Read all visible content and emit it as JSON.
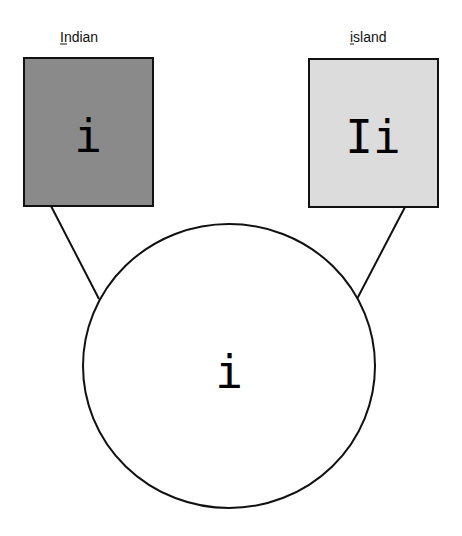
{
  "diagram": {
    "boxes": [
      {
        "id": "left",
        "label": "Indian",
        "mnemonic_index": 0,
        "glyph": "i",
        "fill": "#8a8a8a"
      },
      {
        "id": "right",
        "label": "island",
        "mnemonic_index": 0,
        "glyph": "Ii",
        "fill": "#dcdcdc"
      }
    ],
    "circle": {
      "glyph": "i",
      "fill": "#ffffff"
    },
    "colors": {
      "stroke": "#111111",
      "background": "#ffffff"
    }
  }
}
